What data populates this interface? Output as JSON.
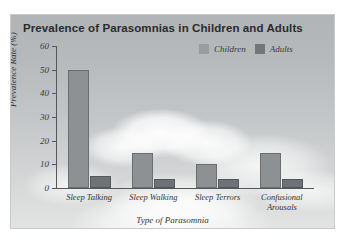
{
  "chart_data": {
    "type": "bar",
    "title": "Prevalence of Parasomnias in Children and Adults",
    "xlabel": "Type of Parasomnia",
    "ylabel": "Prevalence Rate (%)",
    "ylim": [
      0,
      60
    ],
    "yticks": [
      0,
      10,
      20,
      30,
      40,
      50,
      60
    ],
    "grid": false,
    "legend_position": "top-right",
    "categories": [
      "Sleep Talking",
      "Sleep Walking",
      "Sleep Terrors",
      "Confusional Arousals"
    ],
    "series": [
      {
        "name": "Children",
        "color": "#8e9194",
        "values": [
          50,
          15,
          10,
          15
        ]
      },
      {
        "name": "Adults",
        "color": "#6e7276",
        "values": [
          5,
          4,
          4,
          4
        ]
      }
    ]
  },
  "legend": {
    "items": [
      {
        "label": "Children",
        "swatch": "#9a9da0"
      },
      {
        "label": "Adults",
        "swatch": "#72767a"
      }
    ]
  },
  "axis": {
    "y_labels": [
      "60",
      "50",
      "40",
      "30",
      "20",
      "10",
      "0"
    ],
    "y_title": "Prevalence Rate (%)",
    "x_title": "Type of Parasomnia",
    "x_labels": [
      "Sleep Talking",
      "Sleep Walking",
      "Sleep Terrors",
      "Confusional Arousals"
    ]
  },
  "colors": {
    "children_bar": "#8e9194",
    "adults_bar": "#6e7276",
    "axis": "#55585b",
    "title_text": "#2b2b2b",
    "label_text": "#333333"
  }
}
